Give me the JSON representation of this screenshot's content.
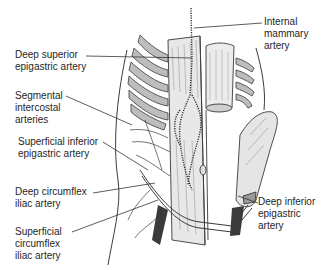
{
  "figure": {
    "type": "anatomical-illustration",
    "colors": {
      "outline": "#3a3a3a",
      "rib_fill": "#bdbdbd",
      "muscle_fill": "#e6e6e6",
      "vessel": "#2e2e2e",
      "leader_line": "#333333",
      "text": "#1f1f1f",
      "background": "#ffffff"
    }
  },
  "labels": [
    {
      "id": "internal-mammary",
      "text": "Internal mammary\nartery",
      "side": "right"
    },
    {
      "id": "deep-superior-epigastric",
      "text": "Deep superior\nepigastric artery",
      "side": "left"
    },
    {
      "id": "segmental-intercostal",
      "text": "Segmental\nintercostal\narteries",
      "side": "left"
    },
    {
      "id": "superficial-inferior-epigastric",
      "text": "Superficial inferior\nepigastric artery",
      "side": "left"
    },
    {
      "id": "deep-circumflex-iliac",
      "text": "Deep circumflex\niliac artery",
      "side": "left"
    },
    {
      "id": "superficial-circumflex-iliac",
      "text": "Superficial\ncircumflex\niliac artery",
      "side": "left"
    },
    {
      "id": "deep-inferior-epigastric",
      "text": "Deep inferior\nepigastric\nartery",
      "side": "right"
    }
  ]
}
